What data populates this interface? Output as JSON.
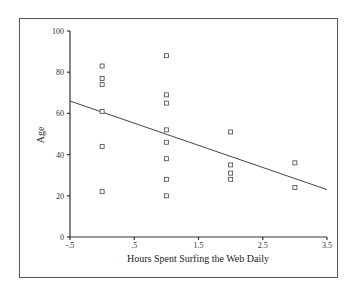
{
  "chart_data": {
    "type": "scatter",
    "title": "",
    "xlabel": "Hours Spent Surfing the Web Daily",
    "ylabel": "Age",
    "xlim": [
      -0.5,
      3.5
    ],
    "ylim": [
      0,
      100
    ],
    "xticks": [
      "-.5",
      ".5",
      "1.5",
      "2.5",
      "3.5"
    ],
    "xtick_values": [
      -0.5,
      0.5,
      1.5,
      2.5,
      3.5
    ],
    "yticks": [
      "0",
      "20",
      "40",
      "60",
      "80",
      "100"
    ],
    "ytick_values": [
      0,
      20,
      40,
      60,
      80,
      100
    ],
    "grid": false,
    "legend": null,
    "marker": "hollow-square",
    "series": [
      {
        "name": "observations",
        "points": [
          {
            "x": 0,
            "y": 83
          },
          {
            "x": 0,
            "y": 77
          },
          {
            "x": 0,
            "y": 74
          },
          {
            "x": 0,
            "y": 61
          },
          {
            "x": 0,
            "y": 44
          },
          {
            "x": 0,
            "y": 22
          },
          {
            "x": 1,
            "y": 88
          },
          {
            "x": 1,
            "y": 69
          },
          {
            "x": 1,
            "y": 65
          },
          {
            "x": 1,
            "y": 52
          },
          {
            "x": 1,
            "y": 46
          },
          {
            "x": 1,
            "y": 38
          },
          {
            "x": 1,
            "y": 28
          },
          {
            "x": 1,
            "y": 20
          },
          {
            "x": 2,
            "y": 51
          },
          {
            "x": 2,
            "y": 35
          },
          {
            "x": 2,
            "y": 31
          },
          {
            "x": 2,
            "y": 28
          },
          {
            "x": 3,
            "y": 36
          },
          {
            "x": 3,
            "y": 24
          }
        ]
      }
    ],
    "fit_line": {
      "type": "linear",
      "x_start": -0.5,
      "y_start": 66,
      "x_end": 3.5,
      "y_end": 23
    }
  }
}
